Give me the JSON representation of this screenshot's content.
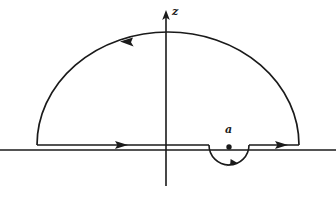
{
  "figure": {
    "kind": "complex-contour-integration-diagram",
    "background_color": "#ffffff",
    "stroke_color": "#1a1a1a",
    "labels": {
      "vertical_axis": "z",
      "pole": "a"
    },
    "geometry": {
      "canvas": {
        "width": 336,
        "height": 200
      },
      "origin": {
        "x": 166,
        "y": 148
      },
      "real_axis": {
        "x_start": 0,
        "x_end": 336,
        "y": 150
      },
      "imaginary_axis": {
        "x": 166,
        "y_top": 12,
        "y_bottom": 186
      },
      "axis_arrow_tip": {
        "x": 166,
        "y": 12
      },
      "large_arc": {
        "center_x": 168,
        "center_y": 145,
        "radius_x": 131,
        "radius_y": 113,
        "left_x": 37,
        "right_x": 299,
        "baseline_y": 145
      },
      "small_arc": {
        "center_x": 229,
        "center_y": 145,
        "radius": 20,
        "direction": "below-axis",
        "left_x": 209,
        "right_x": 249
      },
      "pole_dot": {
        "x": 229,
        "y": 147,
        "radius": 2.6
      }
    },
    "arrows": [
      {
        "name": "large-arc-arrow",
        "position": {
          "x": 128,
          "y": 42
        },
        "direction": "left",
        "meaning": "counterclockwise traversal of large semicircle"
      },
      {
        "name": "left-segment-arrow",
        "position": {
          "x": 120,
          "y": 145
        },
        "direction": "right",
        "meaning": "rightward traversal along real axis"
      },
      {
        "name": "small-arc-arrow",
        "position": {
          "x": 231,
          "y": 165
        },
        "direction": "right",
        "meaning": "indentation passes below the pole"
      },
      {
        "name": "right-segment-arrow",
        "position": {
          "x": 275,
          "y": 145
        },
        "direction": "right",
        "meaning": "rightward traversal along real axis"
      }
    ]
  }
}
